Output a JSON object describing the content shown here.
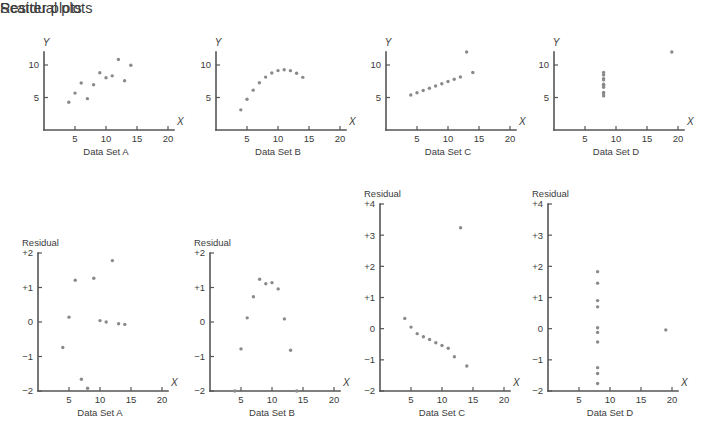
{
  "headings": {
    "scatter": "Scatter plots",
    "residual": "Residual plots"
  },
  "axis_titles": {
    "x": "X",
    "y": "Y",
    "residual": "Residual"
  },
  "captions": {
    "a": "Data Set A",
    "b": "Data Set B",
    "c": "Data Set C",
    "d": "Data Set D"
  },
  "colors": {
    "dot": "#8a8a8a",
    "axis": "#555555",
    "text": "#3b3b3b",
    "background": "#ffffff"
  },
  "ticks": {
    "x": [
      "5",
      "10",
      "15",
      "20"
    ],
    "y_scatter": [
      "5",
      "10"
    ],
    "y_residual_2": [
      "+2",
      "+1",
      "0",
      "-1",
      "-2"
    ],
    "y_residual_4": [
      "+4",
      "+3",
      "+2",
      "+1",
      "0",
      "-1",
      "-2"
    ]
  },
  "chart_data": [
    {
      "type": "scatter",
      "title": "Data Set A",
      "xlabel": "X",
      "ylabel": "Y",
      "xlim": [
        0,
        20
      ],
      "ylim": [
        0,
        12
      ],
      "xticks": [
        5,
        10,
        15,
        20
      ],
      "yticks": [
        5,
        10
      ],
      "grid": false,
      "x": [
        10,
        8,
        13,
        9,
        11,
        14,
        6,
        4,
        12,
        7,
        5
      ],
      "y": [
        8.04,
        6.95,
        7.58,
        8.81,
        8.33,
        9.96,
        7.24,
        4.26,
        10.84,
        4.82,
        5.68
      ]
    },
    {
      "type": "scatter",
      "title": "Data Set B",
      "xlabel": "X",
      "ylabel": "Y",
      "xlim": [
        0,
        20
      ],
      "ylim": [
        0,
        12
      ],
      "xticks": [
        5,
        10,
        15,
        20
      ],
      "yticks": [
        5,
        10
      ],
      "grid": false,
      "x": [
        10,
        8,
        13,
        9,
        11,
        14,
        6,
        4,
        12,
        7,
        5
      ],
      "y": [
        9.14,
        8.14,
        8.74,
        8.77,
        9.26,
        8.1,
        6.13,
        3.1,
        9.13,
        7.26,
        4.74
      ]
    },
    {
      "type": "scatter",
      "title": "Data Set C",
      "xlabel": "X",
      "ylabel": "Y",
      "xlim": [
        0,
        20
      ],
      "ylim": [
        0,
        12
      ],
      "xticks": [
        5,
        10,
        15,
        20
      ],
      "yticks": [
        5,
        10
      ],
      "grid": false,
      "x": [
        10,
        8,
        13,
        9,
        11,
        14,
        6,
        4,
        12,
        7,
        5
      ],
      "y": [
        7.46,
        6.77,
        12.74,
        7.11,
        7.81,
        8.84,
        6.08,
        5.39,
        8.15,
        6.42,
        5.73
      ]
    },
    {
      "type": "scatter",
      "title": "Data Set D",
      "xlabel": "X",
      "ylabel": "Y",
      "xlim": [
        0,
        20
      ],
      "ylim": [
        0,
        12
      ],
      "xticks": [
        5,
        10,
        15,
        20
      ],
      "yticks": [
        5,
        10
      ],
      "grid": false,
      "x": [
        8,
        8,
        8,
        8,
        8,
        8,
        8,
        19,
        8,
        8,
        8
      ],
      "y": [
        6.58,
        5.76,
        7.71,
        8.84,
        8.47,
        7.04,
        5.25,
        12.5,
        5.56,
        7.91,
        6.89
      ]
    },
    {
      "type": "scatter",
      "title": "Residual Data Set A",
      "xlabel": "X",
      "ylabel": "Residual",
      "xlim": [
        0,
        20
      ],
      "ylim": [
        -2,
        2
      ],
      "xticks": [
        5,
        10,
        15,
        20
      ],
      "yticks": [
        -2,
        -1,
        0,
        1,
        2
      ],
      "grid": false,
      "x": [
        10,
        8,
        13,
        9,
        11,
        14,
        6,
        4,
        12,
        7,
        5
      ],
      "y": [
        0.04,
        -1.92,
        -0.05,
        1.27,
        0.0,
        -0.07,
        1.21,
        -0.74,
        1.78,
        -1.66,
        0.14
      ]
    },
    {
      "type": "scatter",
      "title": "Residual Data Set B",
      "xlabel": "X",
      "ylabel": "Residual",
      "xlim": [
        0,
        20
      ],
      "ylim": [
        -2,
        2
      ],
      "xticks": [
        5,
        10,
        15,
        20
      ],
      "yticks": [
        -2,
        -1,
        0,
        1,
        2
      ],
      "grid": false,
      "x": [
        10,
        8,
        13,
        9,
        11,
        14,
        6,
        4,
        12,
        7,
        5
      ],
      "y": [
        1.14,
        1.24,
        -0.82,
        1.11,
        0.96,
        -2.0,
        0.12,
        -2.0,
        0.09,
        0.73,
        -0.78
      ]
    },
    {
      "type": "scatter",
      "title": "Residual Data Set C",
      "xlabel": "X",
      "ylabel": "Residual",
      "xlim": [
        0,
        20
      ],
      "ylim": [
        -2,
        4
      ],
      "xticks": [
        5,
        10,
        15,
        20
      ],
      "yticks": [
        -2,
        -1,
        0,
        1,
        2,
        3,
        4
      ],
      "grid": false,
      "x": [
        10,
        8,
        13,
        9,
        11,
        14,
        6,
        4,
        12,
        7,
        5
      ],
      "y": [
        -0.54,
        -0.35,
        3.24,
        -0.45,
        -0.63,
        -1.2,
        -0.16,
        0.33,
        -0.9,
        -0.26,
        0.05
      ]
    },
    {
      "type": "scatter",
      "title": "Residual Data Set D",
      "xlabel": "X",
      "ylabel": "Residual",
      "xlim": [
        0,
        20
      ],
      "ylim": [
        -2,
        4
      ],
      "xticks": [
        5,
        10,
        15,
        20
      ],
      "yticks": [
        -2,
        -1,
        0,
        1,
        2,
        3,
        4
      ],
      "grid": false,
      "x": [
        8,
        8,
        8,
        8,
        8,
        8,
        8,
        19,
        8,
        8,
        8
      ],
      "y": [
        -0.43,
        -1.25,
        0.7,
        1.83,
        1.46,
        0.03,
        -1.76,
        -0.04,
        -1.44,
        0.9,
        -0.12
      ]
    }
  ]
}
